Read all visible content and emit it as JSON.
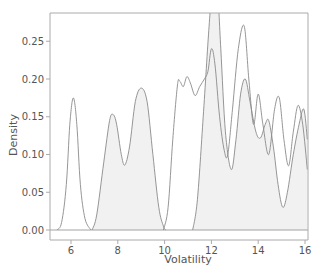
{
  "chart_data": {
    "type": "area",
    "subtype": "kde-density",
    "title": "",
    "xlabel": "Volatility",
    "ylabel": "Density",
    "xlim": [
      5.2,
      16.1
    ],
    "ylim": [
      -0.01,
      0.29
    ],
    "x_ticks": [
      6,
      8,
      10,
      12,
      14,
      16
    ],
    "x_tick_labels": [
      "6",
      "8",
      "10",
      "12",
      "14",
      "16"
    ],
    "y_ticks": [
      0.0,
      0.05,
      0.1,
      0.15,
      0.2,
      0.25
    ],
    "y_tick_labels": [
      "0.00",
      "0.05",
      "0.10",
      "0.15",
      "0.20",
      "0.25"
    ],
    "grid": false,
    "legend": null,
    "colors": {
      "line": "#8a8a8a",
      "fill": "#f1f1f1",
      "axis": "#aaaaaa",
      "text": "#555555"
    },
    "series": [
      {
        "name": "density-1",
        "filled": false,
        "points": [
          [
            5.4,
            0.0
          ],
          [
            5.6,
            0.01
          ],
          [
            5.8,
            0.06
          ],
          [
            5.95,
            0.14
          ],
          [
            6.1,
            0.175
          ],
          [
            6.25,
            0.14
          ],
          [
            6.4,
            0.06
          ],
          [
            6.6,
            0.015
          ],
          [
            6.85,
            0.0
          ]
        ]
      },
      {
        "name": "density-2",
        "filled": true,
        "points": [
          [
            6.9,
            0.0
          ],
          [
            7.1,
            0.02
          ],
          [
            7.4,
            0.09
          ],
          [
            7.65,
            0.145
          ],
          [
            7.8,
            0.153
          ],
          [
            7.95,
            0.14
          ],
          [
            8.15,
            0.1
          ],
          [
            8.3,
            0.086
          ],
          [
            8.5,
            0.11
          ],
          [
            8.75,
            0.17
          ],
          [
            9.0,
            0.188
          ],
          [
            9.25,
            0.17
          ],
          [
            9.5,
            0.1
          ],
          [
            9.75,
            0.03
          ],
          [
            9.95,
            0.005
          ],
          [
            10.05,
            0.0
          ]
        ]
      },
      {
        "name": "density-3",
        "filled": false,
        "points": [
          [
            9.95,
            0.0
          ],
          [
            10.15,
            0.03
          ],
          [
            10.35,
            0.12
          ],
          [
            10.55,
            0.192
          ],
          [
            10.65,
            0.197
          ],
          [
            10.8,
            0.19
          ],
          [
            10.95,
            0.203
          ],
          [
            11.1,
            0.195
          ],
          [
            11.3,
            0.178
          ],
          [
            11.5,
            0.19
          ],
          [
            11.7,
            0.2
          ],
          [
            11.85,
            0.21
          ],
          [
            12.0,
            0.24
          ],
          [
            12.15,
            0.22
          ],
          [
            12.35,
            0.15
          ],
          [
            12.55,
            0.105
          ],
          [
            12.7,
            0.1
          ],
          [
            12.9,
            0.16
          ],
          [
            13.15,
            0.24
          ],
          [
            13.4,
            0.27
          ],
          [
            13.6,
            0.2
          ],
          [
            13.8,
            0.14
          ],
          [
            14.0,
            0.18
          ],
          [
            14.2,
            0.14
          ],
          [
            14.45,
            0.1
          ],
          [
            14.7,
            0.16
          ],
          [
            14.9,
            0.175
          ],
          [
            15.1,
            0.12
          ],
          [
            15.3,
            0.085
          ],
          [
            15.5,
            0.13
          ],
          [
            15.7,
            0.165
          ],
          [
            15.9,
            0.14
          ],
          [
            16.1,
            0.08
          ]
        ]
      },
      {
        "name": "density-4",
        "filled": true,
        "points": [
          [
            11.2,
            0.0
          ],
          [
            11.4,
            0.04
          ],
          [
            11.65,
            0.15
          ],
          [
            11.9,
            0.27
          ],
          [
            12.05,
            0.32
          ],
          [
            12.25,
            0.32
          ],
          [
            12.4,
            0.24
          ],
          [
            12.6,
            0.13
          ],
          [
            12.85,
            0.08
          ],
          [
            13.05,
            0.12
          ],
          [
            13.25,
            0.18
          ],
          [
            13.45,
            0.2
          ],
          [
            13.65,
            0.17
          ],
          [
            13.9,
            0.13
          ],
          [
            14.1,
            0.122
          ],
          [
            14.3,
            0.14
          ],
          [
            14.45,
            0.145
          ],
          [
            14.65,
            0.11
          ],
          [
            14.85,
            0.06
          ],
          [
            15.05,
            0.03
          ],
          [
            15.25,
            0.05
          ],
          [
            15.5,
            0.1
          ],
          [
            15.75,
            0.14
          ],
          [
            15.95,
            0.16
          ],
          [
            16.1,
            0.12
          ]
        ]
      }
    ]
  }
}
